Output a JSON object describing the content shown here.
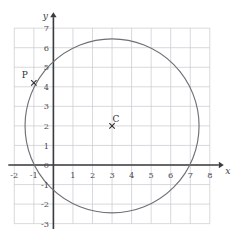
{
  "figure": {
    "name": "coordinate-grid-circle",
    "background_color": "#ffffff",
    "grid_color": "#c9c9cf",
    "axis_color": "#3b3b3f",
    "curve_color": "#6f6f75",
    "label_color": "#2e2e33"
  },
  "axes": {
    "x_label": "x",
    "y_label": "y",
    "x_min": -2,
    "x_max": 8,
    "y_min": -3,
    "y_max": 7,
    "x_ticks": [
      {
        "value": -2,
        "label": "-2"
      },
      {
        "value": -1,
        "label": "-1"
      },
      {
        "value": 0,
        "label": "0"
      },
      {
        "value": 1,
        "label": "1"
      },
      {
        "value": 2,
        "label": "2"
      },
      {
        "value": 3,
        "label": "3"
      },
      {
        "value": 4,
        "label": "4"
      },
      {
        "value": 5,
        "label": "5"
      },
      {
        "value": 6,
        "label": "6"
      },
      {
        "value": 7,
        "label": "7"
      },
      {
        "value": 8,
        "label": "8"
      }
    ],
    "y_ticks": [
      {
        "value": 7,
        "label": "7"
      },
      {
        "value": 6,
        "label": "6"
      },
      {
        "value": 5,
        "label": "5"
      },
      {
        "value": 4,
        "label": "4"
      },
      {
        "value": 3,
        "label": "3"
      },
      {
        "value": 2,
        "label": "2"
      },
      {
        "value": 1,
        "label": "1"
      },
      {
        "value": 0,
        "label": "0"
      },
      {
        "value": -1,
        "label": "-1"
      },
      {
        "value": -2,
        "label": "-2"
      },
      {
        "value": -3,
        "label": "-3"
      }
    ]
  },
  "chart_data": {
    "type": "scatter",
    "title": "",
    "xlabel": "x",
    "ylabel": "y",
    "xlim": [
      -2,
      8
    ],
    "ylim": [
      -3,
      7
    ],
    "grid": true,
    "legend": "none",
    "shapes": [
      {
        "kind": "circle",
        "center_x": 3,
        "center_y": 2,
        "radius": 4.45,
        "stroke": "#6f6f75",
        "fill": "none"
      }
    ],
    "points": [
      {
        "name": "P",
        "label": "P",
        "x": -1,
        "y": 4.2,
        "marker": "x",
        "label_dx": -9,
        "label_dy": -5
      },
      {
        "name": "C",
        "label": "C",
        "x": 3,
        "y": 2,
        "marker": "x",
        "label_dx": 4,
        "label_dy": -4
      }
    ]
  }
}
